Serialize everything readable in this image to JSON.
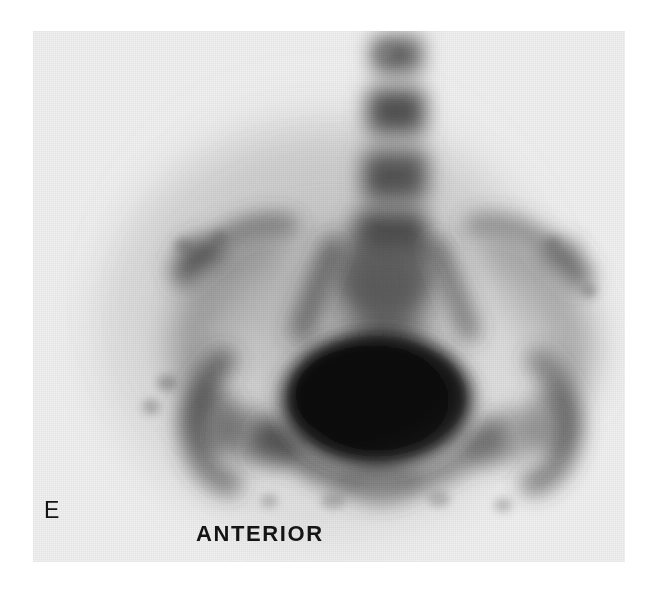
{
  "figure": {
    "panel_letter": "E",
    "view_label": "ANTERIOR",
    "modality": "bone-scintigraphy",
    "background_color": "#ffffff",
    "film_color": "#f1f1f1",
    "ink_color": "#141414"
  },
  "scan": {
    "region": "pelvis-and-lumbar-spine",
    "anatomy": [
      {
        "name": "lumbar-vertebra-upper",
        "label": "",
        "uptake": "moderate"
      },
      {
        "name": "lumbar-vertebra-middle",
        "label": "",
        "uptake": "moderate"
      },
      {
        "name": "lumbar-vertebra-lower",
        "label": "",
        "uptake": "moderate"
      },
      {
        "name": "sacrum",
        "label": "",
        "uptake": "moderate"
      },
      {
        "name": "iliac-crest-left",
        "label": "",
        "uptake": "moderate"
      },
      {
        "name": "iliac-crest-right",
        "label": "",
        "uptake": "moderate"
      },
      {
        "name": "sacroiliac-joint-left",
        "label": "",
        "uptake": "moderate"
      },
      {
        "name": "sacroiliac-joint-right",
        "label": "",
        "uptake": "moderate"
      },
      {
        "name": "bladder",
        "label": "",
        "uptake": "intense"
      },
      {
        "name": "femoral-head-left",
        "label": "",
        "uptake": "moderate"
      },
      {
        "name": "femoral-head-right",
        "label": "",
        "uptake": "moderate"
      },
      {
        "name": "pubic-symphysis",
        "label": "",
        "uptake": "moderate"
      }
    ]
  }
}
